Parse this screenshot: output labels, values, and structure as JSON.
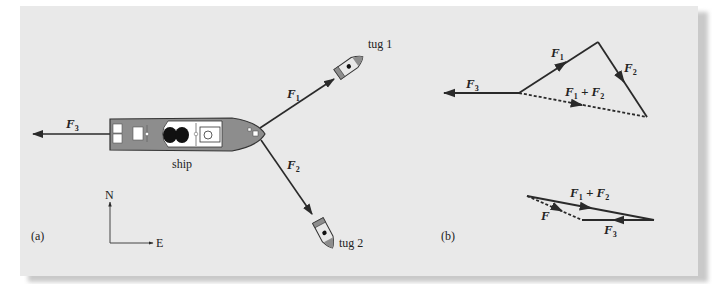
{
  "figure": {
    "panel_a": {
      "label": "(a)",
      "ship_label": "ship",
      "tug1_label": "tug 1",
      "tug2_label": "tug 2",
      "compass": {
        "north": "N",
        "east": "E"
      },
      "forces": {
        "F1": {
          "symbol": "F",
          "subscript": "1"
        },
        "F2": {
          "symbol": "F",
          "subscript": "2"
        },
        "F3": {
          "symbol": "F",
          "subscript": "3"
        }
      }
    },
    "panel_b": {
      "label": "(b)",
      "polygon": {
        "F1": {
          "symbol": "F",
          "subscript": "1"
        },
        "F2": {
          "symbol": "F",
          "subscript": "2"
        },
        "F3": {
          "symbol": "F",
          "subscript": "3"
        },
        "sum": {
          "a": "F",
          "a_sub": "1",
          "plus": " + ",
          "b": "F",
          "b_sub": "2"
        }
      },
      "resultant": {
        "sum": {
          "a": "F",
          "a_sub": "1",
          "plus": " + ",
          "b": "F",
          "b_sub": "2"
        },
        "F": "F",
        "F3": {
          "symbol": "F",
          "subscript": "3"
        }
      }
    },
    "colors": {
      "background": "#e9e9e9",
      "hull": "#8d8d8d",
      "line": "#2a2a2a"
    }
  }
}
